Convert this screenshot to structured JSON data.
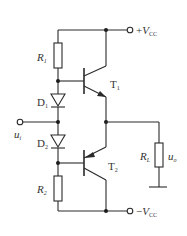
{
  "diagram": {
    "type": "circuit",
    "components": {
      "R1": {
        "label": "R",
        "sub": "1"
      },
      "R2": {
        "label": "R",
        "sub": "2"
      },
      "RL": {
        "label": "R",
        "sub": "L"
      },
      "D1": {
        "label": "D",
        "sub": "1"
      },
      "D2": {
        "label": "D",
        "sub": "2"
      },
      "T1": {
        "label": "T",
        "sub": "1"
      },
      "T2": {
        "label": "T",
        "sub": "2"
      }
    },
    "terminals": {
      "vcc_pos": {
        "prefix": "+",
        "label": "V",
        "sub": "CC"
      },
      "vcc_neg": {
        "prefix": "−",
        "label": "V",
        "sub": "CC"
      },
      "input": {
        "label": "u",
        "sub": "i"
      },
      "output": {
        "label": "u",
        "sub": "o"
      }
    },
    "colors": {
      "stroke": "#2a2a2a",
      "background": "#ffffff"
    }
  }
}
